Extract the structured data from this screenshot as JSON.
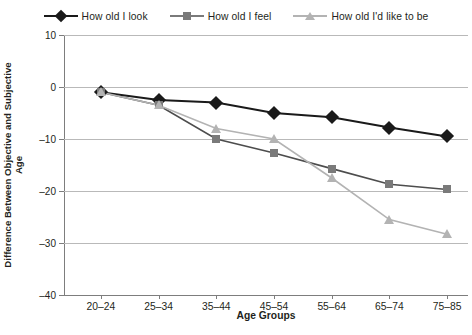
{
  "chart_data": {
    "type": "line",
    "title": "",
    "xlabel": "Age Groups",
    "ylabel": "Difference Between Objective and Subjective Age",
    "ylabel_lines": [
      "Difference Between Objective and Subjective",
      "Age"
    ],
    "categories": [
      "20–24",
      "25–34",
      "35–44",
      "45–54",
      "55–64",
      "65–74",
      "75–85"
    ],
    "ylim": [
      -40,
      10
    ],
    "yticks": [
      10,
      0,
      -10,
      -20,
      -30,
      -40
    ],
    "ytick_labels": [
      "10",
      "0",
      "–10",
      "–20",
      "–30",
      "–40"
    ],
    "grid": "horizontal",
    "legend_position": "top",
    "series": [
      {
        "name": "How old I look",
        "marker": "diamond",
        "color": "#1a1a1a",
        "values": [
          -1.0,
          -2.5,
          -3.0,
          -5.0,
          -5.8,
          -7.8,
          -9.5
        ]
      },
      {
        "name": "How old I feel",
        "marker": "square",
        "color": "#7a7a7a",
        "line_color": "#4d4d4d",
        "values": [
          -1.0,
          -3.5,
          -10.0,
          -12.7,
          -15.7,
          -18.7,
          -19.7
        ]
      },
      {
        "name": "How old I'd like to be",
        "marker": "triangle",
        "color": "#b3b3b3",
        "line_color": "#b3b3b3",
        "values": [
          -1.0,
          -3.5,
          -8.0,
          -10.0,
          -17.5,
          -25.5,
          -28.3
        ]
      }
    ]
  }
}
